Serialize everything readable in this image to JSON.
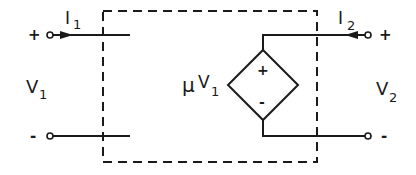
{
  "diagram": {
    "type": "circuit",
    "colors": {
      "stroke": "#1a1a1a",
      "background": "#ffffff"
    },
    "port1": {
      "current_label": "I",
      "current_sub": "1",
      "voltage_label": "V",
      "voltage_sub": "1",
      "plus": "+",
      "minus": "-"
    },
    "port2": {
      "current_label": "I",
      "current_sub": "2",
      "voltage_label": "V",
      "voltage_sub": "2",
      "plus": "+",
      "minus": "-"
    },
    "source": {
      "kind": "dependent-voltage-source",
      "gain_symbol": "μ",
      "control_label": "V",
      "control_sub": "1",
      "plus": "+",
      "minus": "-"
    },
    "boundary": "dashed-box"
  }
}
